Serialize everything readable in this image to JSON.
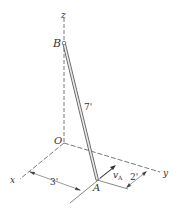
{
  "diagram": {
    "axes": {
      "x": "x",
      "y": "y",
      "z": "z",
      "origin": "O"
    },
    "points": {
      "top": "B",
      "bottom": "A"
    },
    "rod_length": "7'",
    "velocity_label": "v",
    "velocity_subscript": "A",
    "dim_x": "3'",
    "dim_y": "2'"
  }
}
